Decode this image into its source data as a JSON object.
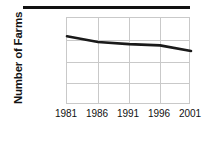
{
  "figure": {
    "top_rule": "decorative-rule",
    "background": "#ffffff",
    "line_color": "#1a1a1a",
    "grid_color": "#c9c9c9"
  },
  "chart_data": {
    "type": "line",
    "title": "",
    "subtitle": "",
    "xlabel": "",
    "ylabel": "Number of Farms",
    "x": [
      1981,
      1986,
      1991,
      1996,
      2001
    ],
    "tick_labels_x": [
      "1981",
      "1986",
      "1991",
      "1996",
      "2001"
    ],
    "tick_labels_y": [
      "0",
      "50,000",
      "100,000",
      "150,000",
      "200,000"
    ],
    "yticks": [
      0,
      50000,
      100000,
      150000,
      200000
    ],
    "values": [
      158000,
      145000,
      140000,
      137000,
      124000
    ],
    "xlim": [
      1981,
      2001
    ],
    "ylim": [
      0,
      200000
    ],
    "grid": true,
    "legend": "none",
    "series": [
      {
        "name": "Number of Farms",
        "values": [
          158000,
          145000,
          140000,
          137000,
          124000
        ]
      }
    ]
  }
}
